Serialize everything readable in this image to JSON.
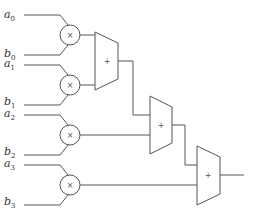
{
  "diagram": {
    "type": "sum of products circuit",
    "inputs": [
      {
        "a": "a",
        "a_sub": "0",
        "b": "b",
        "b_sub": "0"
      },
      {
        "a": "a",
        "a_sub": "1",
        "b": "b",
        "b_sub": "1"
      },
      {
        "a": "a",
        "a_sub": "2",
        "b": "b",
        "b_sub": "2"
      },
      {
        "a": "a",
        "a_sub": "3",
        "b": "b",
        "b_sub": "3"
      }
    ],
    "multiplier_symbol": "×",
    "adder_symbol": "+",
    "colors": {
      "line": "#555555",
      "text": "#333333",
      "background": "#ffffff"
    }
  }
}
